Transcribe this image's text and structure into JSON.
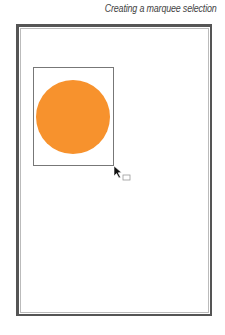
{
  "caption": "Creating a marquee selection",
  "canvas": {
    "page": {
      "border_color": "#555555"
    },
    "marquee": {
      "border_color": "#777777"
    },
    "shape": {
      "type": "circle",
      "fill": "#f7922d"
    },
    "cursor": {
      "type": "marquee-arrow"
    }
  }
}
